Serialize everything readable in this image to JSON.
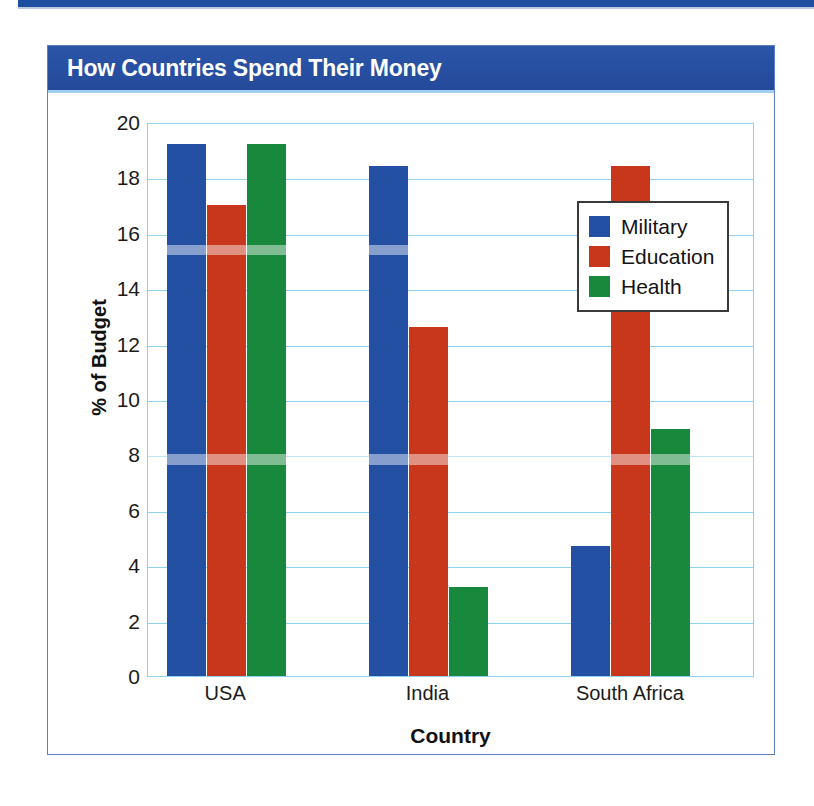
{
  "page": {
    "top_rule_color": "#1e4ea0"
  },
  "card": {
    "title": "How Countries Spend Their Money",
    "title_bar_color": "#2a53a4",
    "border_color": "#5a7fc4"
  },
  "chart_data": {
    "type": "bar",
    "title": "How Countries Spend Their Money",
    "xlabel": "Country",
    "ylabel": "% of Budget",
    "categories": [
      "USA",
      "India",
      "South Africa"
    ],
    "series": [
      {
        "name": "Military",
        "color": "#2450a4",
        "values": [
          19.2,
          18.4,
          4.7
        ]
      },
      {
        "name": "Education",
        "color": "#c8371c",
        "values": [
          17.0,
          12.6,
          18.4
        ]
      },
      {
        "name": "Health",
        "color": "#18883c",
        "values": [
          19.2,
          3.2,
          8.9
        ]
      }
    ],
    "ylim": [
      0,
      20
    ],
    "yticks": [
      0,
      2,
      4,
      6,
      8,
      10,
      12,
      14,
      16,
      18,
      20
    ],
    "ytick_labels": [
      "0",
      "2",
      "4",
      "6",
      "8",
      "10",
      "12",
      "14",
      "16",
      "18",
      "20"
    ],
    "grid": true,
    "grid_color": "#8fd2f0",
    "legend_position": "right-inside",
    "legend_entries": [
      "Military",
      "Education",
      "Health"
    ]
  }
}
